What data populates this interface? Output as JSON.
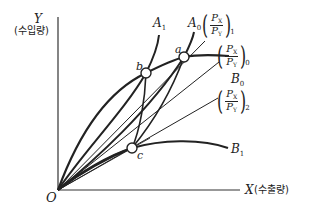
{
  "diagram": {
    "type": "offer-curve trade diagram",
    "axes": {
      "y_label": "Y",
      "y_sublabel": "(수입량)",
      "x_label": "X",
      "x_sublabel": "(수출량)",
      "origin_label": "O"
    },
    "curves": [
      {
        "id": "A1",
        "label": "A",
        "sub": "1"
      },
      {
        "id": "A0",
        "label": "A",
        "sub": "0"
      },
      {
        "id": "B0",
        "label": "B",
        "sub": "0"
      },
      {
        "id": "B1",
        "label": "B",
        "sub": "1"
      }
    ],
    "points": [
      {
        "id": "a",
        "label": "a"
      },
      {
        "id": "b",
        "label": "b"
      },
      {
        "id": "c",
        "label": "c"
      }
    ],
    "price_rays": [
      {
        "id": "ray1",
        "num": "P",
        "num_sub": "X",
        "den": "P",
        "den_sub": "Y",
        "sub": "1"
      },
      {
        "id": "ray0",
        "num": "P",
        "num_sub": "X",
        "den": "P",
        "den_sub": "Y",
        "sub": "0"
      },
      {
        "id": "ray2",
        "num": "P",
        "num_sub": "X",
        "den": "P",
        "den_sub": "Y",
        "sub": "2"
      }
    ],
    "colors": {
      "line": "#222222",
      "background": "#ffffff"
    }
  }
}
